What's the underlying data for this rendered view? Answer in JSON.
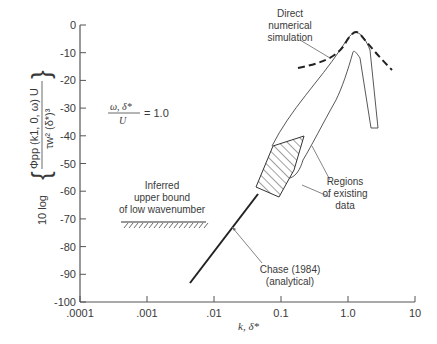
{
  "chart_data": {
    "type": "line",
    "title": "",
    "xlabel": "k, δ*",
    "ylabel": "10 log { Φpp (k1, 0, ω) U / (τw² (δ*)³) }",
    "xscale": "log",
    "xlim": [
      0.0001,
      10
    ],
    "ylim": [
      -100,
      0
    ],
    "x_ticks": [
      ".0001",
      ".001",
      ".01",
      "0.1",
      "1.0",
      "10"
    ],
    "y_ticks": [
      "0",
      "-10",
      "-20",
      "-30",
      "-40",
      "-50",
      "-60",
      "-70",
      "-80",
      "-90",
      "-100"
    ],
    "grid": false,
    "parameter_label": "ω, δ* / U = 1.0",
    "parameter": {
      "numerator": "ω, δ*",
      "denominator": "U",
      "value": "= 1.0"
    },
    "series": [
      {
        "name": "Chase (1984) (analytical)",
        "style": "solid-thick",
        "x": [
          0.004,
          0.05
        ],
        "y": [
          -82,
          -59
        ]
      },
      {
        "name": "Direct numerical simulation",
        "style": "dashed",
        "x": [
          0.4,
          0.7,
          1.0,
          1.4,
          2.0,
          3.0,
          4.3
        ],
        "y": [
          -15.5,
          -14,
          -11,
          -4.5,
          -8,
          -12,
          -16
        ]
      },
      {
        "name": "Regions of existing data (hatched)",
        "style": "hatched-region",
        "x": [
          0.06,
          0.2,
          0.21,
          0.12,
          0.045
        ],
        "y": [
          -43,
          -40,
          -52,
          -62,
          -58
        ]
      },
      {
        "name": "Regions of existing data (envelope)",
        "style": "outline-region",
        "x": [
          0.2,
          0.5,
          1.0,
          1.3,
          1.6,
          2.0,
          1.8,
          1.35,
          1.0,
          0.6,
          0.35,
          0.21
        ],
        "y": [
          -40,
          -25,
          -10,
          -5,
          -10,
          -25,
          -25,
          -9,
          -15,
          -25,
          -35,
          -43
        ]
      },
      {
        "name": "Inferred upper bound of low wavenumber",
        "style": "hatched-line",
        "x": [
          0.0004,
          0.008
        ],
        "y": [
          -71,
          -71
        ]
      }
    ],
    "annotations": [
      "Direct numerical simulation",
      "Regions of existing data",
      "Inferred upper bound of low wavenumber",
      "Chase (1984) (analytical)"
    ]
  },
  "labels": {
    "ylabel_prefix": "10 log",
    "ylabel_num": "Φpp (k1, 0, ω) U",
    "ylabel_den": "τw² (δ*)³",
    "xlabel": "k, δ*",
    "param_num": "ω, δ*",
    "param_den": "U",
    "param_eq": "= 1.0",
    "dns_1": "Direct",
    "dns_2": "numerical",
    "dns_3": "simulation",
    "reg_1": "Regions",
    "reg_2": "of existing",
    "reg_3": "data",
    "inf_1": "Inferred",
    "inf_2": "upper bound",
    "inf_3": "of low wavenumber",
    "chase_1": "Chase (1984)",
    "chase_2": "(analytical)"
  },
  "axes": {
    "x_ticks": [
      ".0001",
      ".001",
      ".01",
      "0.1",
      "1.0",
      "10"
    ],
    "y_ticks": [
      "0",
      "-10",
      "-20",
      "-30",
      "-40",
      "-50",
      "-60",
      "-70",
      "-80",
      "-90",
      "-100"
    ]
  }
}
